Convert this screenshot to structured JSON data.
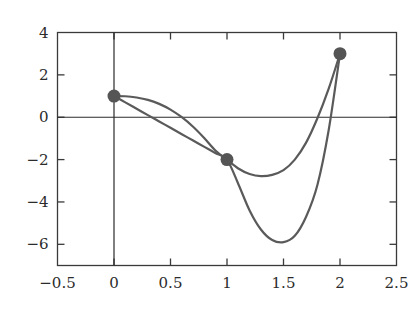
{
  "chart_data": {
    "type": "line",
    "title": "",
    "subtitle": "",
    "xlabel": "",
    "ylabel": "",
    "xlim": [
      -0.5,
      2.5
    ],
    "ylim": [
      -7.0,
      4.0
    ],
    "grid": false,
    "legend": "none",
    "axis_lines": {
      "x_zero": 0,
      "y_zero": 0
    },
    "xticks": [
      -0.5,
      0,
      0.5,
      1,
      1.5,
      2,
      2.5
    ],
    "xtick_labels": [
      "-0.5",
      "0",
      "0.5",
      "1",
      "1.5",
      "2",
      "2.5"
    ],
    "yticks": [
      4,
      2,
      0,
      -2,
      -4,
      -6
    ],
    "ytick_labels": [
      "4",
      "2",
      "0",
      "-2",
      "-4",
      "-6"
    ],
    "series": [
      {
        "name": "shallow-spline",
        "color": "#5a5a5a",
        "linewidth": 2.2,
        "x": [
          0.0,
          0.1,
          0.2,
          0.3,
          0.4,
          0.5,
          0.6,
          0.7,
          0.8,
          0.9,
          1.0,
          1.1,
          1.2,
          1.3,
          1.4,
          1.5,
          1.6,
          1.7,
          1.8,
          1.9,
          2.0
        ],
        "y": [
          1.0,
          0.99,
          0.93,
          0.82,
          0.63,
          0.36,
          0.0,
          -0.45,
          -0.99,
          -1.58,
          -2.0,
          -2.42,
          -2.68,
          -2.78,
          -2.72,
          -2.5,
          -2.0,
          -1.2,
          -0.05,
          1.35,
          3.0
        ]
      },
      {
        "name": "deep-spline",
        "color": "#5a5a5a",
        "linewidth": 2.2,
        "x": [
          0.0,
          0.1,
          0.2,
          0.3,
          0.4,
          0.5,
          0.6,
          0.7,
          0.8,
          0.9,
          1.0,
          1.1,
          1.2,
          1.3,
          1.4,
          1.5,
          1.6,
          1.7,
          1.8,
          1.9,
          2.0
        ],
        "y": [
          1.0,
          0.7,
          0.4,
          0.1,
          -0.2,
          -0.5,
          -0.8,
          -1.1,
          -1.4,
          -1.7,
          -2.0,
          -3.15,
          -4.4,
          -5.3,
          -5.8,
          -5.9,
          -5.6,
          -4.7,
          -3.2,
          -0.6,
          3.0
        ]
      }
    ],
    "points": [
      {
        "x": 0,
        "y": 1,
        "label": "(0, 1)"
      },
      {
        "x": 1,
        "y": -2,
        "label": "(1, -2)"
      },
      {
        "x": 2,
        "y": 3,
        "label": "(2, 3)"
      }
    ],
    "point_color": "#555555",
    "point_radius": 6.5,
    "frame_color": "#3a3a3a",
    "axis_color": "#2b2b2b"
  }
}
